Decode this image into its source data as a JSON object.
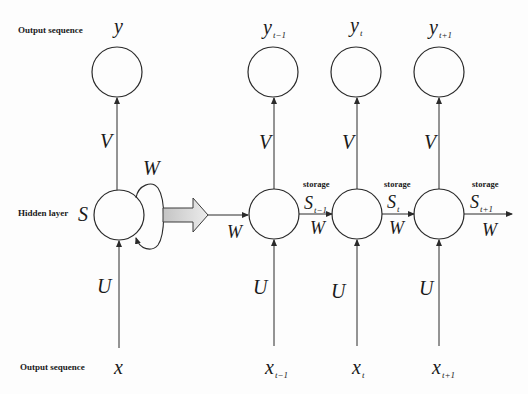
{
  "labels": {
    "output_row_top": "Output sequence",
    "hidden_row": "Hidden layer",
    "output_row_bottom": "Output sequence",
    "storage": "storage"
  },
  "folded": {
    "output": "y",
    "hidden": "S",
    "input": "x",
    "weight_out": "V",
    "weight_in": "U",
    "weight_rec": "W"
  },
  "unfolded": {
    "steps": [
      {
        "output_base": "y",
        "output_sub": "t−1",
        "input_base": "x",
        "input_sub": "t−1",
        "state_base": "S",
        "state_sub": "t−1",
        "V": "V",
        "U": "U",
        "W": "W"
      },
      {
        "output_base": "y",
        "output_sub": "t",
        "input_base": "x",
        "input_sub": "t",
        "state_base": "S",
        "state_sub": "t",
        "V": "V",
        "U": "U",
        "W": "W"
      },
      {
        "output_base": "y",
        "output_sub": "t+1",
        "input_base": "x",
        "input_sub": "t+1",
        "state_base": "S",
        "state_sub": "t+1",
        "V": "V",
        "U": "U",
        "W": "W"
      }
    ],
    "entry_weight": "W"
  },
  "colors": {
    "stroke": "#2a2a2a",
    "arrow_fill_start": "#c8c8c8",
    "arrow_fill_end": "#ececec",
    "background": "#fdfdfd"
  }
}
